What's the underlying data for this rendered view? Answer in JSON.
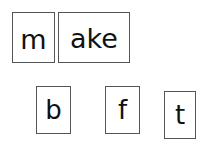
{
  "word_row": {
    "onset": "m",
    "rime": "ake"
  },
  "letter_tiles": [
    {
      "letter": "b"
    },
    {
      "letter": "f"
    },
    {
      "letter": "t"
    }
  ]
}
